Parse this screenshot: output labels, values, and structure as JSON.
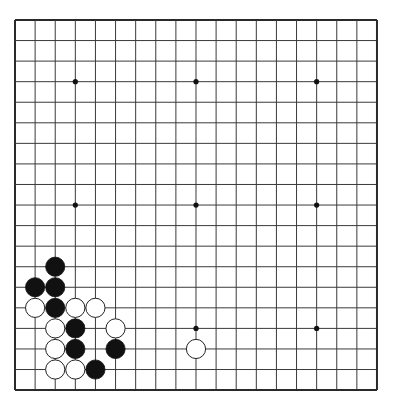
{
  "board": {
    "size": 19,
    "origin_x": 15,
    "origin_y": 20,
    "spacing_x": 20.11,
    "spacing_y": 20.56,
    "line_color": "#3a3a3a",
    "border_color": "#2a2a2a",
    "background": "#ffffff",
    "star_points": [
      [
        3,
        3
      ],
      [
        9,
        3
      ],
      [
        15,
        3
      ],
      [
        3,
        9
      ],
      [
        9,
        9
      ],
      [
        15,
        9
      ],
      [
        3,
        15
      ],
      [
        9,
        15
      ],
      [
        15,
        15
      ]
    ]
  },
  "stones": [
    {
      "color": "black",
      "col": 2,
      "row": 12
    },
    {
      "color": "black",
      "col": 1,
      "row": 13
    },
    {
      "color": "black",
      "col": 2,
      "row": 13
    },
    {
      "color": "white",
      "col": 1,
      "row": 14
    },
    {
      "color": "black",
      "col": 2,
      "row": 14
    },
    {
      "color": "white",
      "col": 3,
      "row": 14
    },
    {
      "color": "white",
      "col": 4,
      "row": 14
    },
    {
      "color": "white",
      "col": 2,
      "row": 15
    },
    {
      "color": "black",
      "col": 3,
      "row": 15
    },
    {
      "color": "white",
      "col": 5,
      "row": 15
    },
    {
      "color": "white",
      "col": 2,
      "row": 16
    },
    {
      "color": "black",
      "col": 3,
      "row": 16
    },
    {
      "color": "black",
      "col": 5,
      "row": 16
    },
    {
      "color": "white",
      "col": 2,
      "row": 17
    },
    {
      "color": "white",
      "col": 3,
      "row": 17
    },
    {
      "color": "black",
      "col": 4,
      "row": 17
    },
    {
      "color": "white",
      "col": 9,
      "row": 16
    }
  ],
  "colors": {
    "black_stone": "#111111",
    "white_stone_fill": "#ffffff",
    "white_stone_stroke": "#222222"
  }
}
